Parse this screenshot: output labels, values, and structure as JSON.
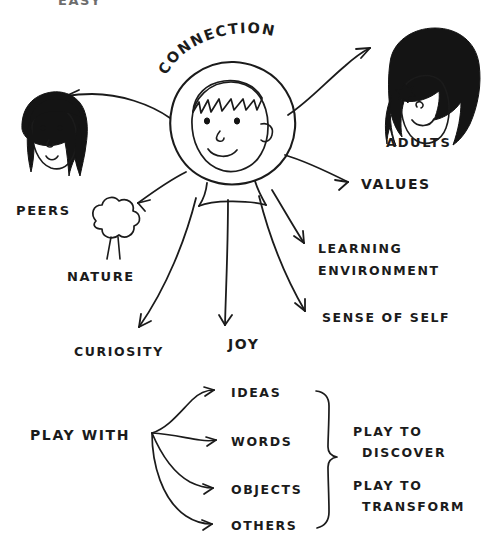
{
  "page": {
    "title": "CONNECTION",
    "background_color": "#ffffff",
    "ink_color": "#1b1b1b",
    "width": 493,
    "height": 557
  },
  "top_cropped_label": {
    "text": "EASY",
    "note": "partially cut off at top edge"
  },
  "center": {
    "arc_label": "CONNECTION",
    "arc_letters": [
      "C",
      "O",
      "N",
      "N",
      "E",
      "C",
      "T",
      "I",
      "O",
      "N"
    ],
    "figure_name": "child-face"
  },
  "branches": [
    {
      "id": "peers",
      "label": "PEERS",
      "has_illustration": true,
      "illustration": "girl-face-dark-hair"
    },
    {
      "id": "adults",
      "label": "ADULTS",
      "has_illustration": true,
      "illustration": "adult-face-dark-hair-flower"
    },
    {
      "id": "values",
      "label": "VALUES",
      "has_illustration": false,
      "illustration": ""
    },
    {
      "id": "learning",
      "label_line1": "LEARNING",
      "label_line2": "ENVIRONMENT",
      "has_illustration": false,
      "illustration": ""
    },
    {
      "id": "sense",
      "label": "SENSE OF SELF",
      "has_illustration": false,
      "illustration": ""
    },
    {
      "id": "nature",
      "label": "NATURE",
      "has_illustration": true,
      "illustration": "tree"
    },
    {
      "id": "curiosity",
      "label": "CURIOSITY",
      "has_illustration": false,
      "illustration": ""
    },
    {
      "id": "joy",
      "label": "JOY",
      "has_illustration": false,
      "illustration": ""
    }
  ],
  "play_section": {
    "source_label": "PLAY WITH",
    "items": [
      "IDEAS",
      "WORDS",
      "OBJECTS",
      "OTHERS"
    ],
    "brace": "curly-brace",
    "outcomes": [
      {
        "line1": "PLAY TO",
        "line2": "DISCOVER"
      },
      {
        "line1": "PLAY TO",
        "line2": "TRANSFORM"
      }
    ]
  }
}
